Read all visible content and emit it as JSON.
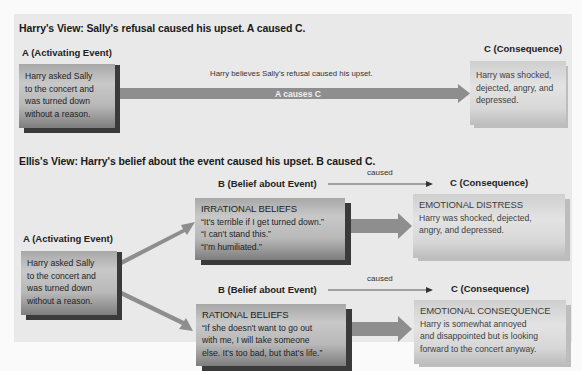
{
  "harrys_view": {
    "title": "Harry's View: Sally's refusal caused his upset. A caused C.",
    "a_label": "A (Activating Event)",
    "a_box": [
      "Harry asked Sally",
      "to the concert and",
      "was turned down",
      "without a reason."
    ],
    "arrow_caption": "Harry believes Sally's refusal caused his upset.",
    "arrow_label": "A causes C",
    "c_label": "C (Consequence)",
    "c_box": [
      "Harry was shocked,",
      "dejected, angry, and",
      "depressed."
    ]
  },
  "ellis_view": {
    "title": "Ellis's View: Harry's belief about the event caused his upset. B caused C.",
    "a_label": "A (Activating Event)",
    "a_box": [
      "Harry asked Sally",
      "to the concert and",
      "was turned down",
      "without a reason."
    ],
    "top": {
      "b_label": "B (Belief about Event)",
      "caused_label": "caused",
      "c_label": "C (Consequence)",
      "b_box": {
        "heading": "IRRATIONAL BELIEFS",
        "lines": [
          "“It's terrible if I get turned down.”",
          "“I can't stand this.”",
          "“I'm humiliated.”"
        ]
      },
      "c_box": {
        "heading": "EMOTIONAL DISTRESS",
        "lines": [
          "Harry was shocked, dejected,",
          "angry, and depressed."
        ]
      }
    },
    "bottom": {
      "b_label": "B (Belief about Event)",
      "caused_label": "caused",
      "c_label": "C (Consequence)",
      "b_box": {
        "heading": "RATIONAL BELIEFS",
        "lines": [
          "“If she doesn't want to go out",
          "with me, I will take someone",
          "else. It's too bad, but that's life.”"
        ]
      },
      "c_box": {
        "heading": "EMOTIONAL CONSEQUENCE",
        "lines": [
          "Harry is somewhat annoyed",
          "and disappointed but is looking",
          "forward to the concert anyway."
        ]
      }
    }
  },
  "colors": {
    "panel_bg": "#e9e9e9",
    "arrow_fill": "#8e8e8e",
    "dark_box_shadow": "#3a3a3a",
    "light_box_shadow": "#bdbdbd"
  }
}
